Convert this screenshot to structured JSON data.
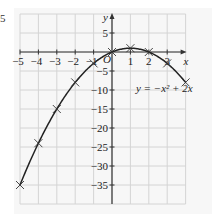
{
  "page_fragment": "5",
  "chart_data": {
    "type": "line",
    "title": "",
    "xlabel": "x",
    "ylabel": "y",
    "origin_label": "O",
    "equation_label": "y = −x² + 2x",
    "xlim": [
      -5,
      4
    ],
    "ylim": [
      -40,
      10
    ],
    "x_ticks": [
      -5,
      -4,
      -3,
      -2,
      -1,
      1,
      2,
      3
    ],
    "y_ticks": [
      5,
      -5,
      -10,
      -15,
      -20,
      -25,
      -30,
      -35
    ],
    "grid": true,
    "x": [
      -5,
      -4,
      -3,
      -2,
      -1,
      0,
      1,
      2,
      3,
      4
    ],
    "values": [
      -35,
      -24,
      -15,
      -8,
      -3,
      0,
      1,
      0,
      -3,
      -8
    ],
    "markers": "x",
    "colors": {
      "curve": "#222222",
      "grid": "#d4d4d4",
      "panel": "#f7f7f7",
      "axis": "#333333"
    }
  }
}
